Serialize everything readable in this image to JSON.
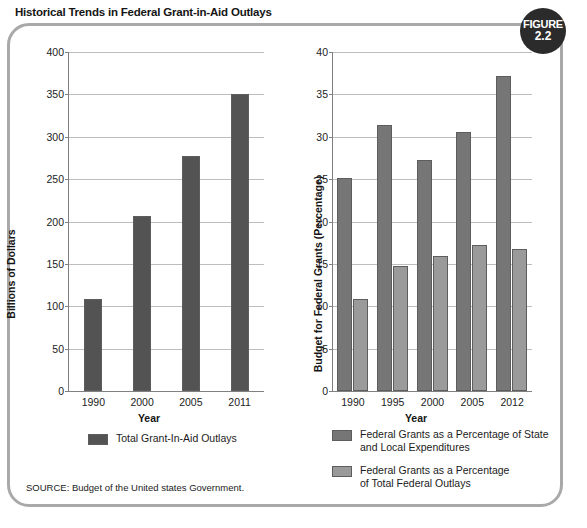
{
  "figure": {
    "title": "Historical Trends in Federal Grant-in-Aid Outlays",
    "badge_line1": "FIGURE",
    "badge_line2": "2.2",
    "source": "SOURCE: Budget of the United states Government.",
    "frame_color": "#a9a9a9",
    "badge_color": "#2b2b2b"
  },
  "chart_data": [
    {
      "type": "bar",
      "id": "left",
      "title": "",
      "categories": [
        "1990",
        "2000",
        "2005",
        "2011"
      ],
      "values": [
        109,
        207,
        277,
        350
      ],
      "series": [
        {
          "name": "Total Grant-In-Aid Outlays",
          "values": [
            109,
            207,
            277,
            350
          ],
          "color": "#535353"
        }
      ],
      "xlabel": "Year",
      "ylabel": "Billions of Dollars",
      "ylim": [
        0,
        400
      ],
      "yticks": [
        0,
        50,
        100,
        150,
        200,
        250,
        300,
        350,
        400
      ],
      "ytick_labels": [
        "0",
        "50",
        "100",
        "150",
        "200",
        "250",
        "300",
        "350",
        "400"
      ],
      "grid": true,
      "legend_position": "bottom",
      "legend": [
        {
          "label": "Total Grant-In-Aid Outlays",
          "color": "#535353"
        }
      ]
    },
    {
      "type": "bar",
      "id": "right",
      "title": "",
      "categories": [
        "1990",
        "1995",
        "2000",
        "2005",
        "2012"
      ],
      "series": [
        {
          "name": "Federal Grants as a Percentage of State and Local Expenditures",
          "values": [
            25.1,
            31.4,
            27.3,
            30.6,
            37.2
          ],
          "color": "#767676"
        },
        {
          "name": "Federal Grants as a Percentage of Total Federal Outlays",
          "values": [
            10.8,
            14.8,
            15.9,
            17.2,
            16.8
          ],
          "color": "#9a9a9a"
        }
      ],
      "xlabel": "Year",
      "ylabel": "Budget for Federal Grants (Percentage)",
      "ylim": [
        0,
        40
      ],
      "yticks": [
        0,
        5,
        10,
        15,
        20,
        25,
        30,
        35,
        40
      ],
      "ytick_labels": [
        "0",
        "5",
        "10",
        "15",
        "20",
        "25",
        "30",
        "35",
        "40"
      ],
      "grid": true,
      "legend_position": "bottom",
      "legend": [
        {
          "label_line1": "Federal Grants as a Percentage of State",
          "label_line2": "and Local Expenditures",
          "color": "#767676"
        },
        {
          "label_line1": "Federal Grants as a Percentage",
          "label_line2": "of Total Federal Outlays",
          "color": "#9a9a9a"
        }
      ]
    }
  ]
}
